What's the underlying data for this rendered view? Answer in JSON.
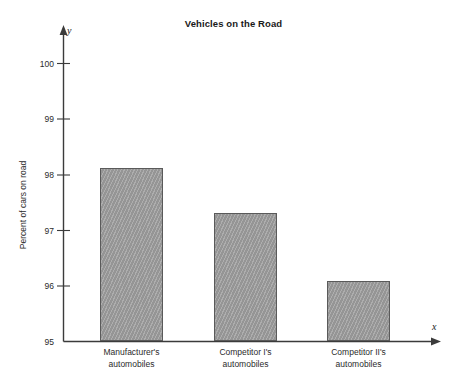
{
  "chart_data": {
    "type": "bar",
    "title": "Vehicles on the Road",
    "xlabel": "",
    "ylabel": "Percent of cars on road",
    "categories": [
      "Manufacturer's automobiles",
      "Competitor I's automobiles",
      "Competitor II's automobiles"
    ],
    "category_lines": [
      [
        "Manufacturer's",
        "automobiles"
      ],
      [
        "Competitor I's",
        "automobiles"
      ],
      [
        "Competitor II's",
        "automobiles"
      ]
    ],
    "values": [
      98.12,
      97.32,
      96.08
    ],
    "ylim": [
      95,
      100
    ],
    "yticks": [
      95,
      96,
      97,
      98,
      99,
      100
    ],
    "ytick_labels": [
      "95",
      "96",
      "97",
      "98",
      "99",
      "100"
    ],
    "grid": false,
    "legend": null,
    "axis_letters": {
      "x": "x",
      "y": "y"
    },
    "bar_color": "#9d9d9d",
    "bar_border_color": "#5a5a5a",
    "axis_color": "#3b3b3b",
    "background_color": "#ffffff"
  }
}
